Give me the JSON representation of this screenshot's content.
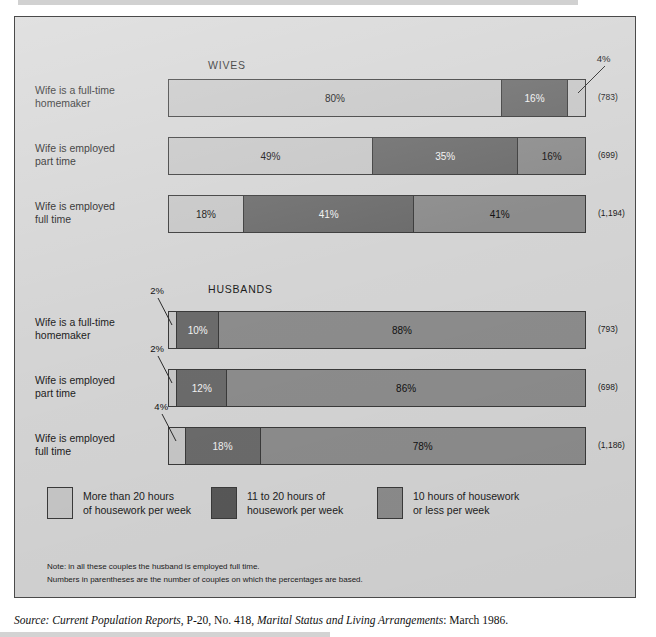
{
  "figure": {
    "group_headings": [
      {
        "label": "WIVES",
        "left": 193,
        "top": 42
      },
      {
        "label": "HUSBANDS",
        "left": 193,
        "top": 266
      }
    ],
    "count_note_prefix": "(",
    "count_note_suffix": ")"
  },
  "chart_data": {
    "type": "bar",
    "subtype": "stacked-horizontal-100pct",
    "title": "",
    "xlabel": "",
    "ylabel": "",
    "xlim": [
      0,
      100
    ],
    "grid": false,
    "legend_position": "bottom",
    "value_suffix": "%",
    "legend": [
      {
        "name": "More than 20 hours of housework per week",
        "line1": "More than 20 hours",
        "line2": "of housework per week",
        "color": "#c6c6c6",
        "key": "light"
      },
      {
        "name": "11 to 20 hours of housework per week",
        "line1": "11 to 20 hours of",
        "line2": "housework per week",
        "color": "#585858",
        "key": "dark"
      },
      {
        "name": "10 hours of housework or less per week",
        "line1": "10 hours of housework",
        "line2": "or less per week",
        "color": "#8c8c8c",
        "key": "medium"
      }
    ],
    "groups": [
      {
        "heading": "WIVES",
        "rows": [
          {
            "category_line1": "Wife is a full-time",
            "category_line2": "homemaker",
            "count": "(783)",
            "count_value": 783,
            "values": [
              80,
              16,
              4
            ],
            "labels": [
              "80%",
              "16%",
              "4%"
            ],
            "colors": [
              "light",
              "dark",
              "light"
            ],
            "callout": {
              "label": "4%",
              "series_index": 2
            }
          },
          {
            "category_line1": "Wife is employed",
            "category_line2": "part time",
            "count": "(699)",
            "count_value": 699,
            "values": [
              49,
              35,
              16
            ],
            "labels": [
              "49%",
              "35%",
              "16%"
            ],
            "colors": [
              "light",
              "dark",
              "medium"
            ],
            "callout": null
          },
          {
            "category_line1": "Wife is employed",
            "category_line2": "full time",
            "count": "(1,194)",
            "count_value": 1194,
            "values": [
              18,
              41,
              41
            ],
            "labels": [
              "18%",
              "41%",
              "41%"
            ],
            "colors": [
              "light",
              "dark",
              "medium"
            ],
            "callout": null
          }
        ]
      },
      {
        "heading": "HUSBANDS",
        "rows": [
          {
            "category_line1": "Wife is a full-time",
            "category_line2": "homemaker",
            "count": "(793)",
            "count_value": 793,
            "values": [
              2,
              10,
              88
            ],
            "labels": [
              "2%",
              "10%",
              "88%"
            ],
            "colors": [
              "light",
              "dark",
              "medium"
            ],
            "callout": {
              "label": "2%",
              "series_index": 0
            }
          },
          {
            "category_line1": "Wife is employed",
            "category_line2": "part time",
            "count": "(698)",
            "count_value": 698,
            "values": [
              2,
              12,
              86
            ],
            "labels": [
              "2%",
              "12%",
              "86%"
            ],
            "colors": [
              "light",
              "dark",
              "medium"
            ],
            "callout": {
              "label": "2%",
              "series_index": 0
            }
          },
          {
            "category_line1": "Wife is employed",
            "category_line2": "full time",
            "count": "(1,186)",
            "count_value": 1186,
            "values": [
              4,
              18,
              78
            ],
            "labels": [
              "4%",
              "18%",
              "78%"
            ],
            "colors": [
              "light",
              "dark",
              "medium"
            ],
            "callout": {
              "label": "4%",
              "series_index": 0
            }
          }
        ]
      }
    ]
  },
  "notes": [
    "Note: in all these couples the husband is employed full time.",
    "Numbers in parentheses are the number of couples on which the percentages are based."
  ],
  "source": {
    "label": "Source:",
    "publication": "Current Population Reports",
    "series": ", P-20, No. 418, ",
    "report_title": "Marital Status and Living Arrangements",
    "date": ": March 1986."
  },
  "colors": {
    "light": "#c6c6c6",
    "dark": "#6b6b6b",
    "dark_legend": "#585858",
    "medium": "#8c8c8c",
    "panel_bg": "#d4d4d4",
    "stroke": "#3a3a3a",
    "text": "#1c1c1c"
  }
}
